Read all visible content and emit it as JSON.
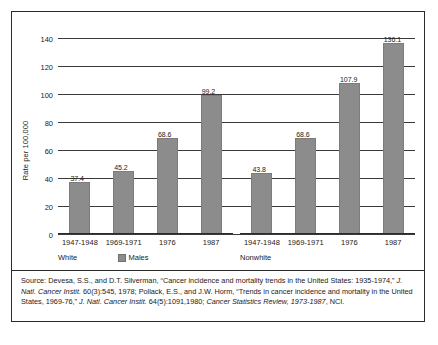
{
  "chart_data": {
    "type": "bar",
    "title": "",
    "xlabel": "",
    "ylabel": "Rate per 100,000",
    "ylim": [
      0,
      140
    ],
    "ytick_step": 20,
    "yticks": [
      140,
      120,
      100,
      80,
      60,
      40,
      20,
      0
    ],
    "grid": true,
    "legend": {
      "position": "below-left-panel",
      "entries": [
        {
          "label": "Males",
          "color": "#8c8c8c"
        }
      ]
    },
    "panels": [
      {
        "name": "White",
        "categories": [
          "1947-1948",
          "1969-1971",
          "1976",
          "1987"
        ],
        "values": [
          37.4,
          45.2,
          68.6,
          99.2
        ],
        "value_labels": [
          "37.4",
          "45.2",
          "68.6",
          "99.2"
        ]
      },
      {
        "name": "Nonwhite",
        "categories": [
          "1947-1948",
          "1969-1971",
          "1976",
          "1987"
        ],
        "values": [
          43.8,
          68.6,
          107.9,
          136.1
        ],
        "value_labels": [
          "43.8",
          "68.6",
          "107.9",
          "136.1"
        ]
      }
    ],
    "series": [
      {
        "name": "Males",
        "color": "#8c8c8c",
        "values": [
          37.4,
          45.2,
          68.6,
          99.2,
          43.8,
          68.6,
          107.9,
          136.1
        ]
      }
    ]
  },
  "axis": {
    "y_title": "Rate per 100,000",
    "ticks": [
      "140",
      "120",
      "100",
      "80",
      "60",
      "40",
      "20",
      "0"
    ]
  },
  "panels": {
    "left": {
      "group_label": "White",
      "categories": [
        "1947-1948",
        "1969-1971",
        "1976",
        "1987"
      ],
      "labels": [
        "37.4",
        "45.2",
        "68.6",
        "99.2"
      ]
    },
    "right": {
      "group_label": "Nonwhite",
      "categories": [
        "1947-1948",
        "1969-1971",
        "1976",
        "1987"
      ],
      "labels": [
        "43.8",
        "68.6",
        "107.9",
        "136.1"
      ]
    }
  },
  "legend": {
    "males_label": "Males"
  },
  "source": {
    "segments": [
      {
        "text": "Source:  Devesa, S.S., and D.T. Silverman, “Cancer incidence and mortality trends in the United States: 1935-1974,” ",
        "italic": false
      },
      {
        "text": "J. Natl. Cancer Instit.",
        "italic": true
      },
      {
        "text": " 60(3):545, 1978; Pollack, E.S., and J.W. Horm, “Trends in cancer incidence and mortality in the United States, 1969-76,” ",
        "italic": false
      },
      {
        "text": "J. Natl. Cancer Instit.",
        "italic": true
      },
      {
        "text": " 64(5):1091,1980; ",
        "italic": false
      },
      {
        "text": "Cancer Statistics Review, 1973-1987",
        "italic": true
      },
      {
        "text": ", NCI.",
        "italic": false
      }
    ]
  },
  "colors": {
    "bar": "#8c8c8c",
    "gridline": "#3a3a3a",
    "border": "#2b2b2b",
    "background": "#ffffff"
  }
}
